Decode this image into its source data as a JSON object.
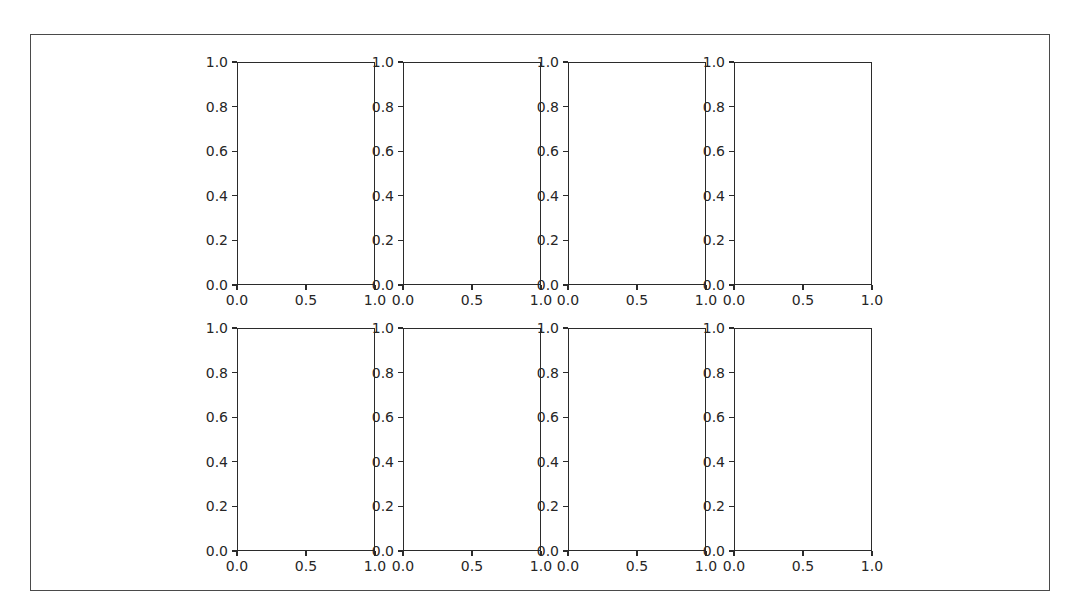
{
  "chart_data": {
    "type": "line",
    "title": "",
    "layout": "2 rows x 4 columns of empty subplots",
    "subplots": [
      {
        "row": 0,
        "col": 0,
        "xlim": [
          0,
          1
        ],
        "ylim": [
          0,
          1
        ],
        "xticks": [
          "0.0",
          "0.5",
          "1.0"
        ],
        "yticks": [
          "0.0",
          "0.2",
          "0.4",
          "0.6",
          "0.8",
          "1.0"
        ],
        "series": []
      },
      {
        "row": 0,
        "col": 1,
        "xlim": [
          0,
          1
        ],
        "ylim": [
          0,
          1
        ],
        "xticks": [
          "0.0",
          "0.5",
          "1.0"
        ],
        "yticks": [
          "0.0",
          "0.2",
          "0.4",
          "0.6",
          "0.8",
          "1.0"
        ],
        "series": []
      },
      {
        "row": 0,
        "col": 2,
        "xlim": [
          0,
          1
        ],
        "ylim": [
          0,
          1
        ],
        "xticks": [
          "0.0",
          "0.5",
          "1.0"
        ],
        "yticks": [
          "0.0",
          "0.2",
          "0.4",
          "0.6",
          "0.8",
          "1.0"
        ],
        "series": []
      },
      {
        "row": 0,
        "col": 3,
        "xlim": [
          0,
          1
        ],
        "ylim": [
          0,
          1
        ],
        "xticks": [
          "0.0",
          "0.5",
          "1.0"
        ],
        "yticks": [
          "0.0",
          "0.2",
          "0.4",
          "0.6",
          "0.8",
          "1.0"
        ],
        "series": []
      },
      {
        "row": 1,
        "col": 0,
        "xlim": [
          0,
          1
        ],
        "ylim": [
          0,
          1
        ],
        "xticks": [
          "0.0",
          "0.5",
          "1.0"
        ],
        "yticks": [
          "0.0",
          "0.2",
          "0.4",
          "0.6",
          "0.8",
          "1.0"
        ],
        "series": []
      },
      {
        "row": 1,
        "col": 1,
        "xlim": [
          0,
          1
        ],
        "ylim": [
          0,
          1
        ],
        "xticks": [
          "0.0",
          "0.5",
          "1.0"
        ],
        "yticks": [
          "0.0",
          "0.2",
          "0.4",
          "0.6",
          "0.8",
          "1.0"
        ],
        "series": []
      },
      {
        "row": 1,
        "col": 2,
        "xlim": [
          0,
          1
        ],
        "ylim": [
          0,
          1
        ],
        "xticks": [
          "0.0",
          "0.5",
          "1.0"
        ],
        "yticks": [
          "0.0",
          "0.2",
          "0.4",
          "0.6",
          "0.8",
          "1.0"
        ],
        "series": []
      },
      {
        "row": 1,
        "col": 3,
        "xlim": [
          0,
          1
        ],
        "ylim": [
          0,
          1
        ],
        "xticks": [
          "0.0",
          "0.5",
          "1.0"
        ],
        "yticks": [
          "0.0",
          "0.2",
          "0.4",
          "0.6",
          "0.8",
          "1.0"
        ],
        "series": []
      }
    ],
    "xlabel": "",
    "ylabel": "",
    "grid": false,
    "legend": null
  },
  "axes_layout": {
    "cols_x": [
      237,
      403,
      568,
      734
    ],
    "rows_y": [
      62,
      328
    ],
    "width": 138,
    "height": 223
  }
}
